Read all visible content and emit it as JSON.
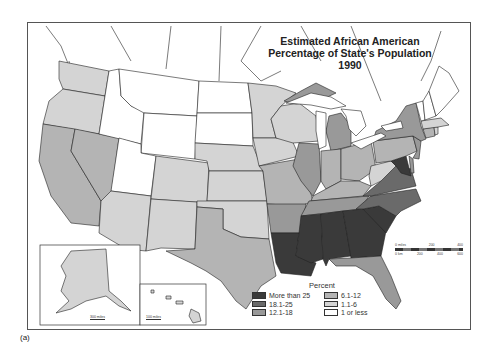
{
  "map": {
    "title_lines": [
      "Estimated African American",
      "Percentage of State's Population",
      "1990"
    ],
    "caption": "(a)",
    "legend": {
      "title": "Percent",
      "items": [
        {
          "label": "More than 25",
          "color": "#3a3a3a"
        },
        {
          "label": "6.1-12",
          "color": "#b4b4b4"
        },
        {
          "label": "18.1-25",
          "color": "#6a6a6a"
        },
        {
          "label": "1.1-6",
          "color": "#d4d4d4"
        },
        {
          "label": "12.1-18",
          "color": "#999999"
        },
        {
          "label": "1 or less",
          "color": "#ffffff"
        }
      ]
    },
    "scale_bar": {
      "miles_labels": [
        "0 miles",
        "200",
        "400"
      ],
      "km_labels": [
        "0 km",
        "200",
        "400",
        "600"
      ]
    },
    "insets": {
      "alaska_scale": "300 miles",
      "hawaii_scale": "100 miles"
    },
    "categories": {
      "c25": "More than 25",
      "c18": "18.1-25",
      "c12": "12.1-18",
      "c6": "6.1-12",
      "c1": "1.1-6",
      "c0": "1 or less"
    },
    "states": [
      {
        "name": "Washington",
        "category": "1.1-6"
      },
      {
        "name": "Oregon",
        "category": "1.1-6"
      },
      {
        "name": "California",
        "category": "6.1-12"
      },
      {
        "name": "Nevada",
        "category": "6.1-12"
      },
      {
        "name": "Idaho",
        "category": "1 or less"
      },
      {
        "name": "Montana",
        "category": "1 or less"
      },
      {
        "name": "Wyoming",
        "category": "1 or less"
      },
      {
        "name": "Utah",
        "category": "1 or less"
      },
      {
        "name": "Arizona",
        "category": "1.1-6"
      },
      {
        "name": "Colorado",
        "category": "1.1-6"
      },
      {
        "name": "New Mexico",
        "category": "1.1-6"
      },
      {
        "name": "North Dakota",
        "category": "1 or less"
      },
      {
        "name": "South Dakota",
        "category": "1 or less"
      },
      {
        "name": "Nebraska",
        "category": "1.1-6"
      },
      {
        "name": "Kansas",
        "category": "1.1-6"
      },
      {
        "name": "Oklahoma",
        "category": "1.1-6"
      },
      {
        "name": "Texas",
        "category": "6.1-12"
      },
      {
        "name": "Minnesota",
        "category": "1.1-6"
      },
      {
        "name": "Iowa",
        "category": "1.1-6"
      },
      {
        "name": "Missouri",
        "category": "6.1-12"
      },
      {
        "name": "Arkansas",
        "category": "12.1-18"
      },
      {
        "name": "Louisiana",
        "category": "More than 25"
      },
      {
        "name": "Wisconsin",
        "category": "1.1-6"
      },
      {
        "name": "Illinois",
        "category": "12.1-18"
      },
      {
        "name": "Michigan",
        "category": "12.1-18"
      },
      {
        "name": "Indiana",
        "category": "6.1-12"
      },
      {
        "name": "Ohio",
        "category": "6.1-12"
      },
      {
        "name": "Kentucky",
        "category": "6.1-12"
      },
      {
        "name": "Tennessee",
        "category": "12.1-18"
      },
      {
        "name": "Mississippi",
        "category": "More than 25"
      },
      {
        "name": "Alabama",
        "category": "More than 25"
      },
      {
        "name": "Georgia",
        "category": "More than 25"
      },
      {
        "name": "Florida",
        "category": "12.1-18"
      },
      {
        "name": "South Carolina",
        "category": "More than 25"
      },
      {
        "name": "North Carolina",
        "category": "18.1-25"
      },
      {
        "name": "Virginia",
        "category": "18.1-25"
      },
      {
        "name": "West Virginia",
        "category": "1.1-6"
      },
      {
        "name": "Maryland",
        "category": "More than 25"
      },
      {
        "name": "Delaware",
        "category": "12.1-18"
      },
      {
        "name": "Pennsylvania",
        "category": "6.1-12"
      },
      {
        "name": "New Jersey",
        "category": "12.1-18"
      },
      {
        "name": "New York",
        "category": "12.1-18"
      },
      {
        "name": "Connecticut",
        "category": "6.1-12"
      },
      {
        "name": "Rhode Island",
        "category": "1.1-6"
      },
      {
        "name": "Massachusetts",
        "category": "1.1-6"
      },
      {
        "name": "Vermont",
        "category": "1 or less"
      },
      {
        "name": "New Hampshire",
        "category": "1 or less"
      },
      {
        "name": "Maine",
        "category": "1 or less"
      },
      {
        "name": "Alaska",
        "category": "1.1-6"
      },
      {
        "name": "Hawaii",
        "category": "1.1-6"
      }
    ]
  }
}
